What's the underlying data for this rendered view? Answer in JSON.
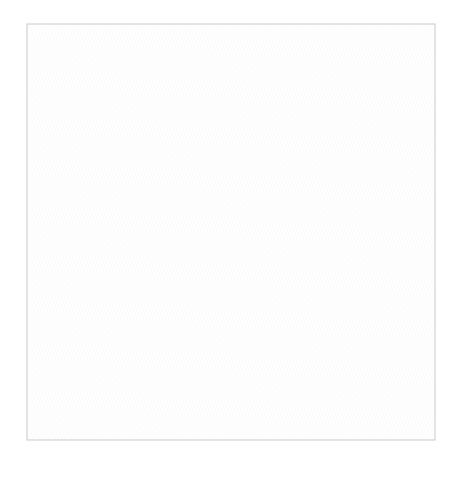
{
  "image": {
    "subject": "Quilt quilting-design illustration: flying geese blocks with feather quilting motifs and feathered borders",
    "background": "#ffffff"
  },
  "quilt": {
    "x": 27,
    "y": 24,
    "width": 408,
    "height": 416,
    "center": {
      "x": 27,
      "y": 24,
      "width": 360,
      "height": 357
    },
    "columns": [
      {
        "name": "left-column",
        "x": 28,
        "width": 115,
        "geese_direction": "up",
        "rows": 6
      },
      {
        "name": "middle-column",
        "x": 143,
        "width": 117,
        "geese_direction": "down",
        "rows": 6
      },
      {
        "name": "right-column",
        "x": 260,
        "width": 115,
        "geese_direction": "up",
        "rows": 6
      }
    ],
    "right_border": {
      "x": 375,
      "y": 24,
      "width": 60,
      "height": 416,
      "motif": "vertical feather vine"
    },
    "bottom_border": {
      "x": 27,
      "y": 381,
      "width": 408,
      "height": 59,
      "motif": "horizontal feather vine"
    }
  },
  "colors": {
    "fabric_white": "#ffffff",
    "fabric_light": "#e4e4e4",
    "fabric_medium": "#cfcfcf",
    "fabric_dark": "#bdbdbd",
    "border_fabric": "#ececec",
    "seam": "#c6c6c6",
    "stitch": "#555555"
  }
}
